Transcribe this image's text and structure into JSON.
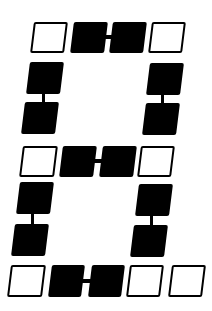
{
  "figure": {
    "colors": {
      "filled": "#000000",
      "outline": "#000000",
      "background": "#ffffff"
    },
    "cells": [
      {
        "id": "r1c1",
        "state": "off",
        "x": 32,
        "y": 22,
        "w": 34,
        "h": 31
      },
      {
        "id": "r1c2",
        "state": "on",
        "x": 72,
        "y": 22,
        "w": 34,
        "h": 31
      },
      {
        "id": "r1c3",
        "state": "on",
        "x": 111,
        "y": 22,
        "w": 34,
        "h": 31
      },
      {
        "id": "r1c4",
        "state": "off",
        "x": 150,
        "y": 22,
        "w": 34,
        "h": 31
      },
      {
        "id": "l1a",
        "state": "on",
        "x": 28,
        "y": 62,
        "w": 34,
        "h": 32
      },
      {
        "id": "l1b",
        "state": "on",
        "x": 23,
        "y": 102,
        "w": 34,
        "h": 32
      },
      {
        "id": "rt1a",
        "state": "on",
        "x": 148,
        "y": 63,
        "w": 34,
        "h": 32
      },
      {
        "id": "rt1b",
        "state": "on",
        "x": 144,
        "y": 103,
        "w": 34,
        "h": 32
      },
      {
        "id": "r2c1",
        "state": "off",
        "x": 21,
        "y": 146,
        "w": 35,
        "h": 31
      },
      {
        "id": "r2c2",
        "state": "on",
        "x": 61,
        "y": 146,
        "w": 34,
        "h": 31
      },
      {
        "id": "r2c3",
        "state": "on",
        "x": 101,
        "y": 146,
        "w": 34,
        "h": 31
      },
      {
        "id": "r2c4",
        "state": "off",
        "x": 139,
        "y": 146,
        "w": 34,
        "h": 31
      },
      {
        "id": "l2a",
        "state": "on",
        "x": 18,
        "y": 182,
        "w": 34,
        "h": 32
      },
      {
        "id": "l2b",
        "state": "on",
        "x": 13,
        "y": 224,
        "w": 34,
        "h": 32
      },
      {
        "id": "rt2a",
        "state": "on",
        "x": 137,
        "y": 184,
        "w": 34,
        "h": 32
      },
      {
        "id": "rt2b",
        "state": "on",
        "x": 132,
        "y": 225,
        "w": 34,
        "h": 32
      },
      {
        "id": "r3c1",
        "state": "off",
        "x": 9,
        "y": 265,
        "w": 35,
        "h": 32
      },
      {
        "id": "r3c2",
        "state": "on",
        "x": 50,
        "y": 265,
        "w": 33,
        "h": 32
      },
      {
        "id": "r3c3",
        "state": "on",
        "x": 90,
        "y": 265,
        "w": 33,
        "h": 32
      },
      {
        "id": "r3c4",
        "state": "off",
        "x": 128,
        "y": 265,
        "w": 34,
        "h": 32
      },
      {
        "id": "r3c5",
        "state": "off",
        "x": 170,
        "y": 265,
        "w": 34,
        "h": 32
      }
    ],
    "links": [
      {
        "id": "top-h",
        "x": 105,
        "y": 35,
        "w": 8,
        "h": 4
      },
      {
        "id": "left-upper-v",
        "x": 42,
        "y": 93,
        "w": 3,
        "h": 10
      },
      {
        "id": "right-upper-v",
        "x": 161,
        "y": 94,
        "w": 3,
        "h": 10
      },
      {
        "id": "mid-h",
        "x": 94,
        "y": 159,
        "w": 8,
        "h": 4
      },
      {
        "id": "left-lower-v",
        "x": 31,
        "y": 213,
        "w": 3,
        "h": 12
      },
      {
        "id": "right-lower-v",
        "x": 150,
        "y": 215,
        "w": 3,
        "h": 11
      },
      {
        "id": "bottom-h",
        "x": 82,
        "y": 279,
        "w": 9,
        "h": 4
      }
    ]
  }
}
